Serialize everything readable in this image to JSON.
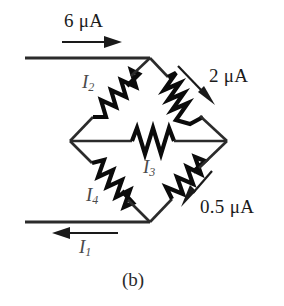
{
  "figure": {
    "caption": "(b)",
    "type": "electrical-circuit-diagram",
    "topology": "diamond bridge network with four diagonal resistors and one central bridging resistor",
    "ink_color": "#1b1b1b",
    "background_color": "#ffffff"
  },
  "currents": {
    "input_top": {
      "label": "6 μA",
      "value": 6,
      "unit": "μA",
      "direction": "right",
      "position": "top-left incoming lead"
    },
    "branch_upper_right": {
      "label": "2 μA",
      "value": 2,
      "unit": "μA",
      "direction": "down-right",
      "position": "upper-right resistor branch"
    },
    "branch_lower_right": {
      "label": "0.5 μA",
      "value": 0.5,
      "unit": "μA",
      "direction": "down-left",
      "position": "lower-right resistor branch"
    }
  },
  "unknowns": {
    "i1": {
      "symbol": "I",
      "subscript": "1",
      "position": "bottom-left outgoing lead",
      "direction": "left"
    },
    "i2": {
      "symbol": "I",
      "subscript": "2",
      "position": "upper-left resistor branch"
    },
    "i3": {
      "symbol": "I",
      "subscript": "3",
      "position": "central bridging resistor"
    },
    "i4": {
      "symbol": "I",
      "subscript": "4",
      "position": "lower-left resistor branch"
    }
  },
  "nodes": {
    "top": {
      "x": 150,
      "y": 58
    },
    "left": {
      "x": 70,
      "y": 141
    },
    "right": {
      "x": 227,
      "y": 141
    },
    "bottom": {
      "x": 150,
      "y": 222
    }
  },
  "elements": {
    "resistor_upper_left": "zigzag resistor between left node and top node",
    "resistor_upper_right": "zigzag resistor between top node and right node",
    "resistor_center": "horizontal zigzag resistor between left node and right node",
    "resistor_lower_left": "zigzag resistor between left node and bottom node",
    "resistor_lower_right": "zigzag resistor between bottom node and right node",
    "lead_top": "horizontal wire entering at top-left to top node",
    "lead_bottom": "horizontal wire leaving at bottom-left from bottom node"
  }
}
